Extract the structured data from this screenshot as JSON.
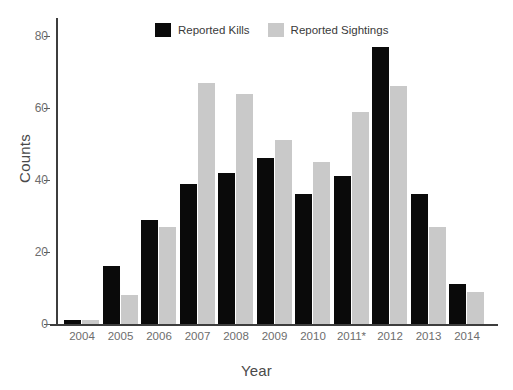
{
  "chart_data": {
    "type": "bar",
    "title": "",
    "xlabel": "Year",
    "ylabel": "Counts",
    "categories": [
      "2004",
      "2005",
      "2006",
      "2007",
      "2008",
      "2009",
      "2010",
      "2011*",
      "2012",
      "2013",
      "2014"
    ],
    "series": [
      {
        "name": "Reported Kills",
        "color": "#0a0a0a",
        "values": [
          1,
          16,
          29,
          39,
          42,
          46,
          36,
          41,
          77,
          36,
          11
        ]
      },
      {
        "name": "Reported Sightings",
        "color": "#c9c9c9",
        "values": [
          1,
          8,
          27,
          67,
          64,
          51,
          45,
          59,
          66,
          27,
          9
        ]
      }
    ],
    "ylim": [
      0,
      85
    ],
    "yticks": [
      0,
      20,
      40,
      60,
      80
    ],
    "ytick_labels": [
      "0",
      "20",
      "40",
      "60",
      "80"
    ],
    "grid": false,
    "legend_position": "top-center",
    "note": "2011* denotes an asterisked category label"
  },
  "legend": {
    "items": [
      {
        "label": "Reported Kills",
        "swatch": "black-square-swatch"
      },
      {
        "label": "Reported Sightings",
        "swatch": "gray-square-swatch"
      }
    ]
  },
  "axes": {
    "x_title": "Year",
    "y_title": "Counts"
  }
}
